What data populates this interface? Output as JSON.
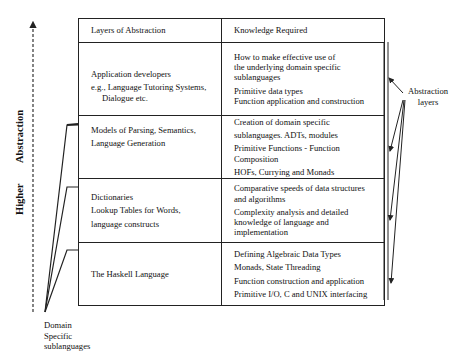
{
  "axis": {
    "higher": "Higher",
    "abstraction": "Abstraction"
  },
  "table": {
    "headers": [
      "Layers of Abstraction",
      "Knowledge Required"
    ],
    "rows": [
      {
        "layer": [
          "Application developers",
          "e.g., Language Tutoring Systems,",
          "Dialogue etc."
        ],
        "knowledge": [
          "How to make effective use of",
          "the underlying domain specific",
          "sublanguages",
          "Primitive data types",
          "Function application and construction"
        ]
      },
      {
        "layer": [
          "Models of Parsing, Semantics,",
          "Language Generation"
        ],
        "knowledge": [
          "Creation of domain specific",
          "sublanguages. ADTs, modules",
          "Primitive Functions - Function Composition",
          "HOFs, Currying and Monads"
        ]
      },
      {
        "layer": [
          "Dictionaries",
          "Lookup Tables for Words,",
          "language constructs"
        ],
        "knowledge": [
          "Comparative speeds of data structures",
          "and algorithms",
          "Complexity analysis and detailed",
          "knowledge of language and implementation"
        ]
      },
      {
        "layer": [
          "The Haskell Language"
        ],
        "knowledge": [
          "Defining Algebraic Data Types",
          "Monads, State Threading",
          "Function construction and application",
          "Primitive I/O, C and UNIX interfacing"
        ]
      }
    ]
  },
  "labels": {
    "abstraction_layers": [
      "Abstraction",
      "layers"
    ],
    "domain_specific": [
      "Domain",
      "Specific",
      "sublanguages"
    ]
  }
}
